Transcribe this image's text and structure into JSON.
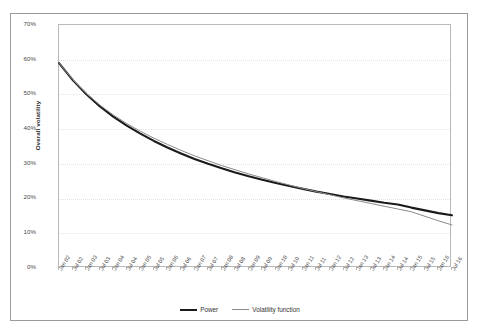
{
  "chart_data": {
    "type": "line",
    "title": "",
    "xlabel": "",
    "ylabel": "Overall volatility",
    "ylim": [
      0,
      0.7
    ],
    "ytick_labels": [
      "0%",
      "10%",
      "20%",
      "30%",
      "40%",
      "50%",
      "60%",
      "70%"
    ],
    "ytick_values": [
      0,
      10,
      20,
      30,
      40,
      50,
      60,
      70
    ],
    "grid": true,
    "legend_position": "bottom-center",
    "x": [
      "Jan 02",
      "Jul 02",
      "Jan 03",
      "Jul 03",
      "Jan 04",
      "Jul 04",
      "Jan 05",
      "Jul 05",
      "Jan 06",
      "Jul 06",
      "Jan 07",
      "Jul 07",
      "Jan 08",
      "Jul 08",
      "Jan 09",
      "Jul 09",
      "Jan 10",
      "Jul 10",
      "Jan 11",
      "Jul 11",
      "Jan 12",
      "Jul 12",
      "Jan 13",
      "Jul 13",
      "Jan 14",
      "Jul 14",
      "Jan 15",
      "Jul 15",
      "Jan 16",
      "Jul 16"
    ],
    "series": [
      {
        "name": "Power",
        "color": "#1a1a1a",
        "width": 2.1,
        "values": [
          59.0,
          54.2,
          50.1,
          46.6,
          43.6,
          41.0,
          38.7,
          36.6,
          34.7,
          33.0,
          31.4,
          30.0,
          28.7,
          27.5,
          26.4,
          25.4,
          24.5,
          23.6,
          22.8,
          22.0,
          21.3,
          20.6,
          20.0,
          19.4,
          18.8,
          18.3,
          17.4,
          16.6,
          15.8,
          15.2
        ]
      },
      {
        "name": "Volatility function",
        "color": "#8a8a8a",
        "width": 1.0,
        "values": [
          59.0,
          54.3,
          50.3,
          47.0,
          44.1,
          41.6,
          39.4,
          37.4,
          35.6,
          33.9,
          32.3,
          30.9,
          29.5,
          28.3,
          27.1,
          26.0,
          24.9,
          23.9,
          22.9,
          22.0,
          21.1,
          20.2,
          19.4,
          18.6,
          17.8,
          17.0,
          16.2,
          14.9,
          13.6,
          12.4
        ]
      }
    ]
  },
  "legend": {
    "entries": [
      {
        "label": "Power"
      },
      {
        "label": "Volatility function"
      }
    ]
  },
  "axis": {
    "y_title": "Overall volatility"
  }
}
